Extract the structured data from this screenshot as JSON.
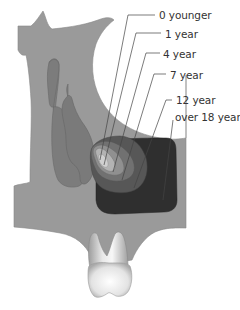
{
  "diagram": {
    "labels": [
      {
        "id": "age-0",
        "text": "0 younger",
        "x": 159,
        "y": 9
      },
      {
        "id": "age-1",
        "text": "1 year",
        "x": 165,
        "y": 28
      },
      {
        "id": "age-4",
        "text": "4 year",
        "x": 163,
        "y": 48
      },
      {
        "id": "age-7",
        "text": "7 year",
        "x": 170,
        "y": 69
      },
      {
        "id": "age-12",
        "text": "12 year",
        "x": 176,
        "y": 94
      },
      {
        "id": "age-18",
        "text": "over 18 year",
        "x": 175,
        "y": 111
      }
    ],
    "colors": {
      "background": "#ffffff",
      "bone": "#9a9a9a",
      "cavity_light": "#7d7d7d",
      "stage_0": "#c4c4c4",
      "stage_1": "#b0b0b0",
      "stage_4": "#8f8f8f",
      "stage_7": "#6e6e6e",
      "stage_12": "#555555",
      "stage_18": "#2e2e2e",
      "tooth_light": "#f2f2f2",
      "tooth_shadow": "#a8a8a8",
      "leader_line": "#444444",
      "text": "#333333"
    }
  }
}
